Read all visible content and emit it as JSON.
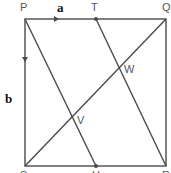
{
  "diagram": {
    "type": "geometry",
    "points": [
      {
        "name": "P",
        "label": "P",
        "x": 25,
        "y": 19
      },
      {
        "name": "Q",
        "label": "Q",
        "x": 166,
        "y": 19
      },
      {
        "name": "R",
        "label": "R",
        "x": 166,
        "y": 166
      },
      {
        "name": "S",
        "label": "S",
        "x": 25,
        "y": 166
      },
      {
        "name": "T",
        "label": "T",
        "x": 96,
        "y": 19
      },
      {
        "name": "U",
        "label": "U",
        "x": 96,
        "y": 166
      },
      {
        "name": "V",
        "label": "V",
        "x": 72,
        "y": 117
      },
      {
        "name": "W",
        "label": "W",
        "x": 119,
        "y": 68
      }
    ],
    "vectors": [
      {
        "name": "a",
        "label": "a",
        "from": "P",
        "direction": "PQ"
      },
      {
        "name": "b",
        "label": "b",
        "from": "P",
        "direction": "PS"
      }
    ],
    "segments": [
      "PQ",
      "QR",
      "RS",
      "SP",
      "SQ",
      "PU",
      "TR"
    ],
    "colors": {
      "line": "#4a4a4a",
      "label": "#555555",
      "vector_label": "#111111"
    }
  }
}
